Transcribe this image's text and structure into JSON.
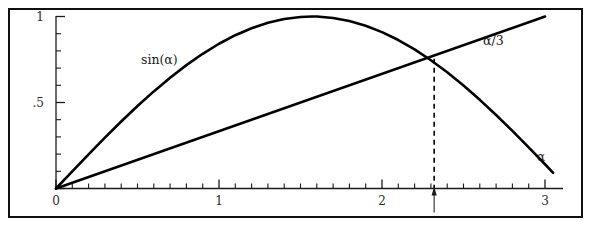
{
  "figure": {
    "title": "",
    "frame": {
      "border_color": "#101010",
      "background": "#ffffff"
    }
  },
  "chart_data": {
    "type": "line",
    "title": "",
    "xlabel": "α",
    "ylabel": "",
    "xlim": [
      0,
      3.1
    ],
    "ylim": [
      0,
      1.05
    ],
    "grid": false,
    "legend_position": "inline-annotation",
    "x_ticks_major": [
      0,
      1,
      2,
      3
    ],
    "x_tick_labels": [
      "0",
      "1",
      "2",
      "3"
    ],
    "x_tick_minor_step": 0.1,
    "y_ticks_major": [
      0,
      0.5,
      1
    ],
    "y_tick_labels": [
      "0",
      ".5",
      "1"
    ],
    "y_tick_minor_step": 0.1,
    "series": [
      {
        "name": "sin(α)",
        "label": "sin(α)",
        "color": "#000000",
        "expression": "sin(x)",
        "x": [
          0,
          0.1,
          0.2,
          0.3,
          0.4,
          0.5,
          0.6,
          0.7,
          0.8,
          0.9,
          1.0,
          1.1,
          1.2,
          1.3,
          1.4,
          1.5,
          1.5708,
          1.6,
          1.7,
          1.8,
          1.9,
          2.0,
          2.1,
          2.2,
          2.3,
          2.4,
          2.5,
          2.6,
          2.7,
          2.8,
          2.9,
          3.0,
          3.05
        ],
        "y": [
          0.0,
          0.0998,
          0.1987,
          0.2955,
          0.3894,
          0.4794,
          0.5646,
          0.6442,
          0.7174,
          0.7833,
          0.8415,
          0.8912,
          0.932,
          0.9636,
          0.9854,
          0.9975,
          1.0,
          0.9996,
          0.9917,
          0.9738,
          0.9463,
          0.9093,
          0.8632,
          0.8085,
          0.7457,
          0.6755,
          0.5985,
          0.5155,
          0.4274,
          0.335,
          0.2392,
          0.1411,
          0.0912
        ]
      },
      {
        "name": "α/3",
        "label": "α/3",
        "color": "#000000",
        "expression": "x/3",
        "x": [
          0,
          3.0
        ],
        "y": [
          0.0,
          1.0
        ]
      }
    ],
    "annotations": [
      {
        "name": "intersection-marker",
        "kind": "dashed-drop-line",
        "x": 2.32,
        "y": 0.755,
        "note": "solution of sin(α) = α/3"
      },
      {
        "name": "axis-pointer",
        "kind": "up-arrow-below-axis",
        "x": 2.32
      }
    ],
    "labels": {
      "sin_label": "sin(α)",
      "line_label": "α/3",
      "x_axis_label": "α"
    }
  },
  "labels": {
    "sin_curve": "sin(α)",
    "linear_curve": "α/3",
    "x_axis": "α",
    "y_top": "1",
    "y_mid": ".5",
    "origin": "0",
    "x_one": "1",
    "x_two": "2",
    "x_three": "3"
  }
}
